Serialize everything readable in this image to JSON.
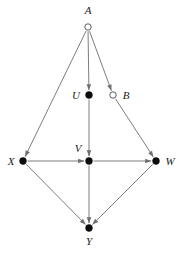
{
  "figure": {
    "type": "directed-graph",
    "width": 182,
    "height": 253,
    "background_color": "#ffffff",
    "edge_color": "#6e6e6e",
    "node_fill_color": "#0d0d0d",
    "node_hollow_fill_color": "#ffffff",
    "label_color": "#1a1a1a"
  },
  "nodes": [
    {
      "id": "A",
      "label": "A",
      "x": 88,
      "y": 27,
      "style": "hollow",
      "radius": 3.2,
      "label_x": 88,
      "label_y": 14,
      "label_anchor": "middle"
    },
    {
      "id": "U",
      "label": "U",
      "x": 89,
      "y": 95,
      "style": "filled",
      "radius": 3.4,
      "label_x": 76,
      "label_y": 99,
      "label_anchor": "middle"
    },
    {
      "id": "B",
      "label": "B",
      "x": 113,
      "y": 95,
      "style": "hollow",
      "radius": 3.2,
      "label_x": 126,
      "label_y": 99,
      "label_anchor": "middle"
    },
    {
      "id": "X",
      "label": "X",
      "x": 23,
      "y": 161,
      "style": "filled",
      "radius": 3.4,
      "label_x": 11,
      "label_y": 165,
      "label_anchor": "middle"
    },
    {
      "id": "V",
      "label": "V",
      "x": 89,
      "y": 161,
      "style": "filled",
      "radius": 3.4,
      "label_x": 78,
      "label_y": 152,
      "label_anchor": "middle"
    },
    {
      "id": "W",
      "label": "W",
      "x": 156,
      "y": 161,
      "style": "filled",
      "radius": 3.4,
      "label_x": 170,
      "label_y": 165,
      "label_anchor": "middle"
    },
    {
      "id": "Y",
      "label": "Y",
      "x": 89,
      "y": 228,
      "style": "filled",
      "radius": 3.4,
      "label_x": 89,
      "label_y": 245,
      "label_anchor": "middle"
    }
  ],
  "edges": [
    {
      "id": "A-X",
      "from": "A",
      "to": "X",
      "directed": true
    },
    {
      "id": "A-U",
      "from": "A",
      "to": "U",
      "directed": true
    },
    {
      "id": "A-B",
      "from": "A",
      "to": "B",
      "directed": true
    },
    {
      "id": "U-V",
      "from": "U",
      "to": "V",
      "directed": true
    },
    {
      "id": "B-W",
      "from": "B",
      "to": "W",
      "directed": true
    },
    {
      "id": "X-V",
      "from": "X",
      "to": "V",
      "directed": true
    },
    {
      "id": "V-W",
      "from": "V",
      "to": "W",
      "directed": true
    },
    {
      "id": "X-Y",
      "from": "X",
      "to": "Y",
      "directed": true
    },
    {
      "id": "V-Y",
      "from": "V",
      "to": "Y",
      "directed": true
    },
    {
      "id": "W-Y",
      "from": "W",
      "to": "Y",
      "directed": true
    }
  ]
}
